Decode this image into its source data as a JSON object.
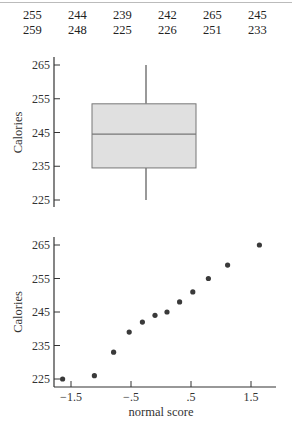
{
  "data_table": {
    "rows": [
      [
        "255",
        "244",
        "239",
        "242",
        "265",
        "245"
      ],
      [
        "259",
        "248",
        "225",
        "226",
        "251",
        "233"
      ]
    ]
  },
  "chart_data": [
    {
      "type": "boxplot",
      "title": "",
      "xlabel": "",
      "ylabel": "Calories",
      "yticks": [
        225,
        235,
        245,
        255,
        265
      ],
      "ytick_labels": [
        "225",
        "235",
        "245",
        "255",
        "265"
      ],
      "ylim": [
        223,
        267
      ],
      "min": 225,
      "q1": 234.5,
      "median": 244.5,
      "q3": 253.5,
      "max": 265,
      "box_color": "#e0e0e0",
      "grid": false
    },
    {
      "type": "scatter",
      "title": "",
      "xlabel": "normal score",
      "ylabel": "Calories",
      "xticks": [
        -1.5,
        -0.5,
        0.5,
        1.5
      ],
      "xtick_labels": [
        "−1.5",
        "−.5",
        ".5",
        "1.5"
      ],
      "yticks": [
        225,
        235,
        245,
        255,
        265
      ],
      "ytick_labels": [
        "225",
        "235",
        "245",
        "255",
        "265"
      ],
      "xlim": [
        -1.8,
        1.9
      ],
      "ylim": [
        223,
        267
      ],
      "x": [
        -1.64,
        -1.11,
        -0.79,
        -0.53,
        -0.31,
        -0.1,
        0.1,
        0.31,
        0.53,
        0.79,
        1.11,
        1.64
      ],
      "y": [
        225,
        226,
        233,
        239,
        242,
        244,
        245,
        248,
        251,
        255,
        259,
        265
      ],
      "point_color": "#3a3a3a",
      "grid": false
    }
  ]
}
